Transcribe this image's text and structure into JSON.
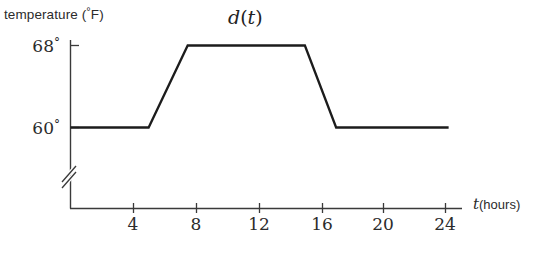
{
  "figure": {
    "background_color": "#ffffff",
    "ink_color": "#2b2b2b",
    "curve_color": "#1c1c1c"
  },
  "title": {
    "function_name": "d",
    "open_paren": "(",
    "variable": "t",
    "close_paren": ")",
    "full": "d(t)"
  },
  "yaxis": {
    "label_text": "temperature (",
    "label_degree": "°",
    "label_unit": "F)",
    "label_full": "temperature (°F)",
    "ticks": [
      {
        "value": 68,
        "label": "68",
        "degree": "°"
      },
      {
        "value": 60,
        "label": "60",
        "degree": "°"
      }
    ],
    "has_axis_break": true,
    "break_symbol": "double-slash"
  },
  "xaxis": {
    "label_variable": "t",
    "label_unit": "(hours)",
    "label_full": "t (hours)",
    "ticks": [
      {
        "value": 4,
        "label": "4"
      },
      {
        "value": 8,
        "label": "8"
      },
      {
        "value": 12,
        "label": "12"
      },
      {
        "value": 16,
        "label": "16"
      },
      {
        "value": 20,
        "label": "20"
      },
      {
        "value": 24,
        "label": "24"
      }
    ]
  },
  "chart_data": {
    "type": "line",
    "title": "d(t)",
    "xlabel": "t (hours)",
    "ylabel": "temperature (°F)",
    "xlim": [
      0,
      25
    ],
    "ylim": [
      58,
      70
    ],
    "grid": false,
    "legend": "none",
    "axis_break_y": true,
    "series": [
      {
        "name": "d(t)",
        "x": [
          0,
          5,
          7.5,
          15,
          17,
          24.2
        ],
        "y": [
          60,
          60,
          68,
          68,
          60,
          60
        ]
      }
    ],
    "annotations": [
      "Piecewise linear thermostat curve: constant 60°F until t=5 h, linear rise to 68°F by t=7.5 h, constant 68°F until t=15 h, linear fall to 60°F by t=17 h, constant 60°F through t=24 h."
    ]
  }
}
